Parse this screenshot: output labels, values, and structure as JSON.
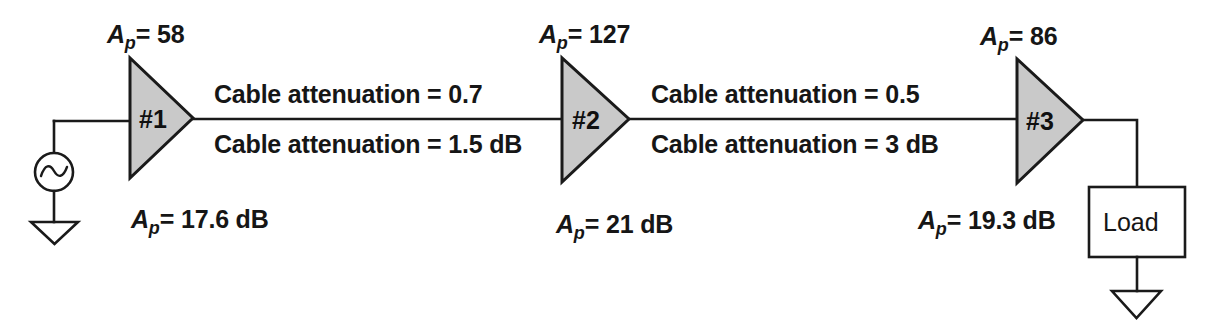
{
  "diagram": {
    "colors": {
      "line": "#1a1a1a",
      "amplifier_fill": "#c9c9c9",
      "background": "#ffffff",
      "text": "#161616"
    },
    "source": {
      "name": "ac-source",
      "symbol": "sine-wave"
    },
    "amplifiers": [
      {
        "id": "amp-1",
        "number_label": "#1",
        "gain_top_prefix": "A",
        "gain_top_subscript": "p",
        "gain_top_value": "= 58",
        "gain_top_full": "Ap = 58",
        "gain_bottom_prefix": "A",
        "gain_bottom_subscript": "p",
        "gain_bottom_value": "= 17.6 dB",
        "gain_bottom_full": "Ap = 17.6 dB"
      },
      {
        "id": "amp-2",
        "number_label": "#2",
        "gain_top_prefix": "A",
        "gain_top_subscript": "p",
        "gain_top_value": "= 127",
        "gain_top_full": "Ap = 127",
        "gain_bottom_prefix": "A",
        "gain_bottom_subscript": "p",
        "gain_bottom_value": "= 21 dB",
        "gain_bottom_full": "Ap = 21 dB"
      },
      {
        "id": "amp-3",
        "number_label": "#3",
        "gain_top_prefix": "A",
        "gain_top_subscript": "p",
        "gain_top_value": "= 86",
        "gain_top_full": "Ap = 86",
        "gain_bottom_prefix": "A",
        "gain_bottom_subscript": "p",
        "gain_bottom_value": "= 19.3 dB",
        "gain_bottom_full": "Ap = 19.3 dB"
      }
    ],
    "cables": [
      {
        "id": "cable-1",
        "above_label": "Cable attenuation = 0.7",
        "below_label": "Cable attenuation = 1.5 dB"
      },
      {
        "id": "cable-2",
        "above_label": "Cable attenuation = 0.5",
        "below_label": "Cable attenuation = 3 dB"
      }
    ],
    "load": {
      "label": "Load"
    },
    "grounds": [
      {
        "id": "ground-source"
      },
      {
        "id": "ground-load"
      }
    ]
  }
}
